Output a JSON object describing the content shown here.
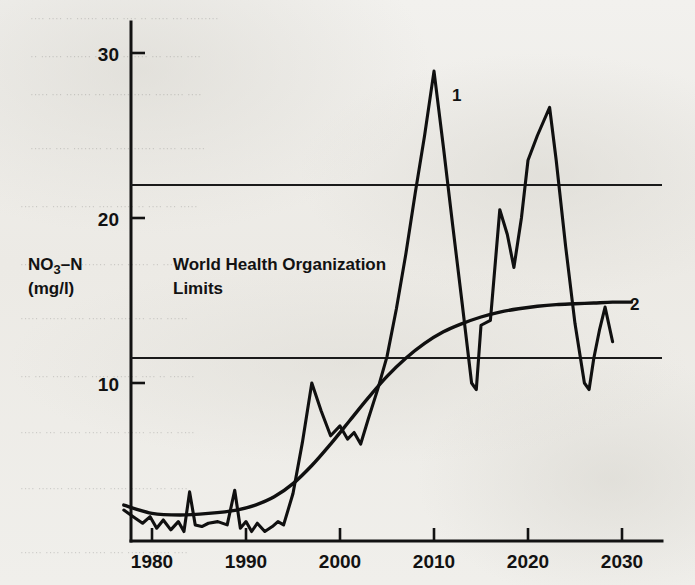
{
  "figure": {
    "background_color": "#efefec",
    "ink_color": "#121212"
  },
  "labels": {
    "y_axis_line1": "NO",
    "y_axis_sub": "3",
    "y_axis_line1b": "–N",
    "y_axis_line2": "(mg/l)",
    "who_line1": "World Health Organization",
    "who_line2": "Limits",
    "series1": "1",
    "series2": "2"
  },
  "chart_data": {
    "type": "line",
    "title": "",
    "xlabel": "",
    "ylabel": "NO3–N (mg/l)",
    "xlim": [
      1976,
      2032
    ],
    "ylim": [
      0,
      32
    ],
    "xticks": [
      1980,
      1990,
      2000,
      2010,
      2020,
      2030
    ],
    "xticklabels": [
      "1980",
      "1990",
      "2000",
      "2010",
      "2020",
      "2030"
    ],
    "yticks": [
      10,
      20,
      30
    ],
    "yticklabels": [
      "10",
      "20",
      "30"
    ],
    "grid": false,
    "legend": "inline-end-labels",
    "annotations": [
      {
        "text": "World Health Organization Limits",
        "x": 1991.5,
        "y": 18.3
      },
      {
        "text": "1",
        "x": 2010.9,
        "y": 27.4
      },
      {
        "text": "2",
        "x": 2030.8,
        "y": 14.9
      }
    ],
    "reference_lines": [
      {
        "name": "WHO upper limit",
        "y": 22.0,
        "orientation": "horizontal"
      },
      {
        "name": "WHO lower limit",
        "y": 11.5,
        "orientation": "horizontal"
      }
    ],
    "series": [
      {
        "name": "1",
        "description": "Measured / fluctuating nitrate-nitrogen concentration",
        "x": [
          1977.0,
          1978.0,
          1979.0,
          1979.8,
          1980.5,
          1981.2,
          1982.0,
          1982.8,
          1983.4,
          1984.0,
          1984.6,
          1985.3,
          1986.0,
          1987.0,
          1988.0,
          1988.8,
          1989.4,
          1990.0,
          1990.6,
          1991.2,
          1992.0,
          1992.8,
          1993.4,
          1994.0,
          1995.0,
          1996.0,
          1997.0,
          1998.0,
          1999.0,
          2000.0,
          2000.8,
          2001.5,
          2002.2,
          2003.0,
          2004.0,
          2005.0,
          2006.0,
          2007.0,
          2008.0,
          2009.0,
          2010.0,
          2011.0,
          2012.0,
          2013.0,
          2014.0,
          2014.5,
          2015.0,
          2016.0,
          2017.0,
          2017.8,
          2018.5,
          2019.3,
          2020.0,
          2021.0,
          2022.3,
          2023.0,
          2024.0,
          2025.0,
          2026.0,
          2026.5,
          2027.0,
          2027.6,
          2028.2,
          2029.0
        ],
        "y": [
          2.3,
          1.9,
          1.5,
          1.9,
          1.2,
          1.7,
          1.1,
          1.6,
          1.0,
          3.4,
          1.4,
          1.3,
          1.5,
          1.6,
          1.4,
          3.5,
          1.2,
          1.6,
          1.0,
          1.5,
          1.0,
          1.3,
          1.6,
          1.4,
          3.3,
          6.4,
          10.0,
          8.3,
          6.8,
          7.4,
          6.6,
          7.0,
          6.3,
          7.8,
          9.6,
          11.6,
          14.5,
          17.8,
          21.5,
          25.0,
          28.9,
          24.3,
          19.5,
          14.8,
          10.0,
          9.6,
          13.5,
          13.8,
          20.5,
          19.0,
          17.0,
          20.0,
          23.5,
          25.0,
          26.7,
          23.5,
          18.3,
          13.6,
          10.0,
          9.6,
          11.5,
          13.2,
          14.6,
          12.5
        ]
      },
      {
        "name": "2",
        "description": "Smoothed trend / model curve",
        "x": [
          1977.0,
          1980.0,
          1983.0,
          1986.0,
          1989.0,
          1991.0,
          1993.0,
          1995.0,
          1997.0,
          1999.0,
          2001.0,
          2003.0,
          2005.0,
          2007.0,
          2009.0,
          2011.0,
          2013.0,
          2015.0,
          2017.0,
          2019.0,
          2021.0,
          2023.0,
          2025.0,
          2027.0,
          2029.0,
          2031.0
        ],
        "y": [
          2.6,
          2.1,
          2.0,
          2.1,
          2.3,
          2.6,
          3.1,
          3.9,
          5.0,
          6.3,
          7.7,
          9.1,
          10.4,
          11.5,
          12.4,
          13.1,
          13.6,
          14.0,
          14.3,
          14.5,
          14.65,
          14.75,
          14.8,
          14.85,
          14.9,
          14.9
        ]
      }
    ]
  }
}
